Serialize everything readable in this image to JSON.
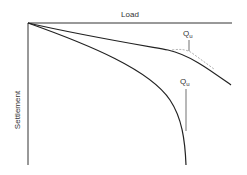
{
  "diagram": {
    "x_axis_label": "Load",
    "y_axis_label": "Settlement",
    "curves": [
      {
        "name": "gradual-failure-curve",
        "annotation": {
          "main": "Q",
          "sub": "u"
        }
      },
      {
        "name": "plunging-failure-curve",
        "annotation": {
          "main": "Q",
          "sub": "u"
        }
      }
    ]
  }
}
